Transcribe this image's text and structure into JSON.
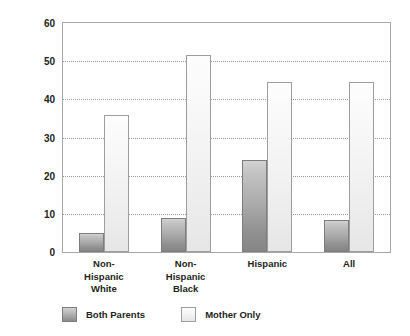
{
  "chart_data": {
    "type": "bar",
    "title": "",
    "xlabel": "",
    "ylabel": "Percent Living in Poverty",
    "ylim": [
      0,
      60
    ],
    "yticks": [
      0,
      10,
      20,
      30,
      40,
      50,
      60
    ],
    "ytick_labels": [
      "0",
      "10",
      "20",
      "30",
      "40",
      "50",
      "60"
    ],
    "grid": true,
    "legend_position": "bottom-left",
    "categories": [
      "Non-\nHispanic\nWhite",
      "Non-\nHispanic\nBlack",
      "Hispanic",
      "All"
    ],
    "series": [
      {
        "name": "Both Parents",
        "color": "#a9a9a9",
        "values": [
          5,
          9,
          24,
          8.5
        ]
      },
      {
        "name": "Mother Only",
        "color": "#efefef",
        "values": [
          36,
          51.5,
          44.5,
          44.5
        ]
      }
    ]
  },
  "colors": {
    "axis": "#a7a7a7",
    "gridline": "#9a9a9a",
    "text": "#231f20",
    "background": "#ffffff"
  }
}
